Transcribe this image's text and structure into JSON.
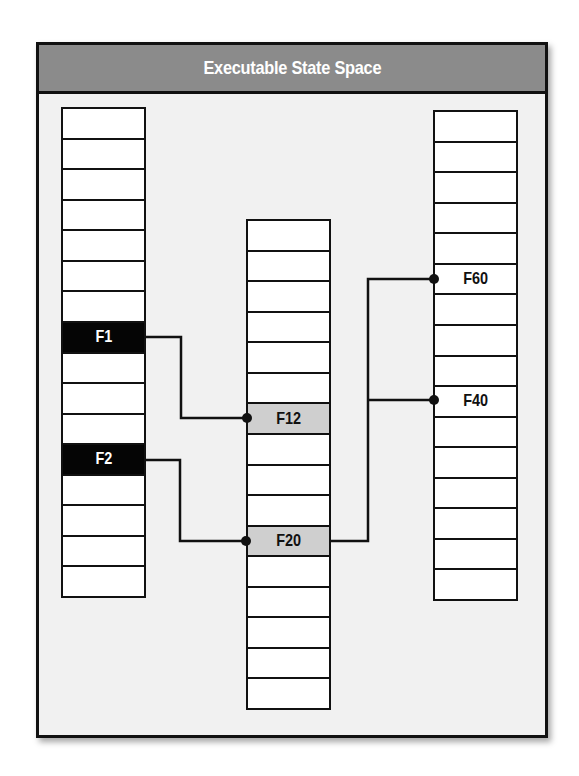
{
  "title": "Executable State Space",
  "colors": {
    "title_bar": "#8b8b8b",
    "frame_bg": "#f1f1f1",
    "highlight_dark": "#050505",
    "highlight_gray": "#cfcfcf",
    "line": "#111111"
  },
  "columns": [
    {
      "id": "left",
      "cell_count": 16,
      "cells": [
        {
          "label": ""
        },
        {
          "label": ""
        },
        {
          "label": ""
        },
        {
          "label": ""
        },
        {
          "label": ""
        },
        {
          "label": ""
        },
        {
          "label": ""
        },
        {
          "label": "F1",
          "style": "dark"
        },
        {
          "label": ""
        },
        {
          "label": ""
        },
        {
          "label": ""
        },
        {
          "label": "F2",
          "style": "dark"
        },
        {
          "label": ""
        },
        {
          "label": ""
        },
        {
          "label": ""
        },
        {
          "label": ""
        }
      ]
    },
    {
      "id": "middle",
      "cell_count": 16,
      "cells": [
        {
          "label": ""
        },
        {
          "label": ""
        },
        {
          "label": ""
        },
        {
          "label": ""
        },
        {
          "label": ""
        },
        {
          "label": ""
        },
        {
          "label": "F12",
          "style": "gray"
        },
        {
          "label": ""
        },
        {
          "label": ""
        },
        {
          "label": ""
        },
        {
          "label": "F20",
          "style": "gray"
        },
        {
          "label": ""
        },
        {
          "label": ""
        },
        {
          "label": ""
        },
        {
          "label": ""
        },
        {
          "label": ""
        }
      ]
    },
    {
      "id": "right",
      "cell_count": 16,
      "cells": [
        {
          "label": ""
        },
        {
          "label": ""
        },
        {
          "label": ""
        },
        {
          "label": ""
        },
        {
          "label": ""
        },
        {
          "label": "F60",
          "style": "white"
        },
        {
          "label": ""
        },
        {
          "label": ""
        },
        {
          "label": ""
        },
        {
          "label": "F40",
          "style": "white"
        },
        {
          "label": ""
        },
        {
          "label": ""
        },
        {
          "label": ""
        },
        {
          "label": ""
        },
        {
          "label": ""
        },
        {
          "label": ""
        }
      ]
    }
  ],
  "connections": [
    {
      "from": "F1",
      "to": "F12"
    },
    {
      "from": "F2",
      "to": "F20"
    },
    {
      "from": "F20",
      "to": "F60"
    },
    {
      "from": "F20",
      "to": "F40"
    }
  ]
}
